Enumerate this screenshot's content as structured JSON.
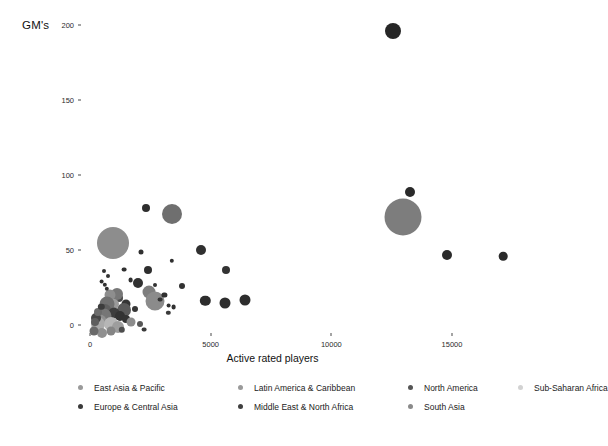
{
  "chart_data": {
    "type": "scatter",
    "title": "",
    "xlabel": "Active rated players",
    "ylabel": "GM's",
    "xlim": [
      -750,
      18000
    ],
    "ylim": [
      -12,
      210
    ],
    "xticks": [
      0,
      5000,
      10000,
      15000
    ],
    "xtick_labels": [
      "0",
      "5000",
      "10000",
      "15000"
    ],
    "yticks": [
      0,
      50,
      100,
      150,
      200
    ],
    "ytick_labels": [
      "0",
      "50",
      "100",
      "150",
      "200"
    ],
    "grid": false,
    "legend_position": "bottom",
    "size_encoding": "population / federation size",
    "color_encoding": "region",
    "legend": [
      {
        "label": "East Asia & Pacific",
        "color": "#9a9a9a"
      },
      {
        "label": "Latin America & Caribbean",
        "color": "#9a9a9a"
      },
      {
        "label": "North America",
        "color": "#555555"
      },
      {
        "label": "Sub-Saharan Africa",
        "color": "#d2d2d2"
      },
      {
        "label": "Europe & Central Asia",
        "color": "#3a3a3a"
      },
      {
        "label": "Middle East & North Africa",
        "color": "#3f3f3f"
      },
      {
        "label": "South Asia",
        "color": "#8a8a8a"
      }
    ],
    "points": [
      {
        "x": 12560,
        "y": 196,
        "r": 8.0,
        "color": "#262626",
        "region": "Europe & Central Asia"
      },
      {
        "x": 13250,
        "y": 89,
        "r": 5.0,
        "color": "#2a2a2a",
        "region": "Europe & Central Asia"
      },
      {
        "x": 12950,
        "y": 72,
        "r": 18.5,
        "color": "#7d7d7d",
        "region": "South Asia"
      },
      {
        "x": 2320,
        "y": 78,
        "r": 4.0,
        "color": "#2e2e2e",
        "region": "Europe & Central Asia"
      },
      {
        "x": 3400,
        "y": 74,
        "r": 10.0,
        "color": "#6f6f6f",
        "region": "East Asia & Pacific"
      },
      {
        "x": 960,
        "y": 55,
        "r": 16.0,
        "color": "#8d8d8d",
        "region": "East Asia & Pacific"
      },
      {
        "x": 14780,
        "y": 47,
        "r": 5.0,
        "color": "#2b2b2b",
        "region": "Europe & Central Asia"
      },
      {
        "x": 17130,
        "y": 46,
        "r": 4.3,
        "color": "#2b2b2b",
        "region": "Europe & Central Asia"
      },
      {
        "x": 4620,
        "y": 50,
        "r": 5.0,
        "color": "#303030",
        "region": "Europe & Central Asia"
      },
      {
        "x": 5630,
        "y": 37,
        "r": 4.0,
        "color": "#333333",
        "region": "Europe & Central Asia"
      },
      {
        "x": 2100,
        "y": 49,
        "r": 2.5,
        "color": "#303030",
        "region": "Europe & Central Asia"
      },
      {
        "x": 3380,
        "y": 43,
        "r": 2.2,
        "color": "#303030",
        "region": "Europe & Central Asia"
      },
      {
        "x": 4780,
        "y": 16,
        "r": 5.2,
        "color": "#2d2d2d",
        "region": "Europe & Central Asia"
      },
      {
        "x": 5590,
        "y": 15,
        "r": 5.5,
        "color": "#2d2d2d",
        "region": "Europe & Central Asia"
      },
      {
        "x": 6430,
        "y": 17,
        "r": 5.5,
        "color": "#2d2d2d",
        "region": "Europe & Central Asia"
      },
      {
        "x": 1980,
        "y": 28,
        "r": 5.0,
        "color": "#313131",
        "region": "Europe & Central Asia"
      },
      {
        "x": 2460,
        "y": 22,
        "r": 6.5,
        "color": "#7e7e7e",
        "region": "East Asia & Pacific"
      },
      {
        "x": 2700,
        "y": 16,
        "r": 9.5,
        "color": "#8b8b8b",
        "region": "East Asia & Pacific"
      },
      {
        "x": 1680,
        "y": 30,
        "r": 2.4,
        "color": "#303030",
        "region": "Europe & Central Asia"
      },
      {
        "x": 3080,
        "y": 20,
        "r": 2.6,
        "color": "#303030",
        "region": "Europe & Central Asia"
      },
      {
        "x": 3260,
        "y": 13,
        "r": 2.4,
        "color": "#303030",
        "region": "Europe & Central Asia"
      },
      {
        "x": 3460,
        "y": 12,
        "r": 2.4,
        "color": "#303030",
        "region": "Europe & Central Asia"
      },
      {
        "x": 3240,
        "y": 8,
        "r": 2.2,
        "color": "#3a3a3a",
        "region": "Middle East & North Africa"
      },
      {
        "x": 1480,
        "y": 14,
        "r": 4.5,
        "color": "#353535",
        "region": "Europe & Central Asia"
      },
      {
        "x": 1410,
        "y": 10,
        "r": 7.0,
        "color": "#5a5a5a",
        "region": "Europe & Central Asia"
      },
      {
        "x": 1210,
        "y": 18,
        "r": 4.0,
        "color": "#4a4a4a",
        "region": "Europe & Central Asia"
      },
      {
        "x": 1100,
        "y": 21,
        "r": 6.0,
        "color": "#777777",
        "region": "Latin America & Caribbean"
      },
      {
        "x": 980,
        "y": 14,
        "r": 5.0,
        "color": "#9a9a9a",
        "region": "Latin America & Caribbean"
      },
      {
        "x": 840,
        "y": 20,
        "r": 5.5,
        "color": "#8e8e8e",
        "region": "Latin America & Caribbean"
      },
      {
        "x": 700,
        "y": 14,
        "r": 7.5,
        "color": "#707070",
        "region": "Latin America & Caribbean"
      },
      {
        "x": 620,
        "y": 10,
        "r": 6.0,
        "color": "#5f5f5f",
        "region": "Europe & Central Asia"
      },
      {
        "x": 1000,
        "y": 8,
        "r": 5.5,
        "color": "#3d3d3d",
        "region": "Europe & Central Asia"
      },
      {
        "x": 1230,
        "y": 6,
        "r": 5.0,
        "color": "#333333",
        "region": "Europe & Central Asia"
      },
      {
        "x": 1500,
        "y": 4,
        "r": 4.0,
        "color": "#343434",
        "region": "Europe & Central Asia"
      },
      {
        "x": 1700,
        "y": 2,
        "r": 4.5,
        "color": "#8c8c8c",
        "region": "Latin America & Caribbean"
      },
      {
        "x": 2060,
        "y": 1,
        "r": 3.0,
        "color": "#575757",
        "region": "Europe & Central Asia"
      },
      {
        "x": 560,
        "y": 6,
        "r": 7.5,
        "color": "#767676",
        "region": "Latin America & Caribbean"
      },
      {
        "x": 430,
        "y": 3,
        "r": 6.5,
        "color": "#8f8f8f",
        "region": "Sub-Saharan Africa"
      },
      {
        "x": 350,
        "y": 1,
        "r": 7.0,
        "color": "#aaaaaa",
        "region": "Sub-Saharan Africa"
      },
      {
        "x": 880,
        "y": 1,
        "r": 7.0,
        "color": "#b6b6b6",
        "region": "Sub-Saharan Africa"
      },
      {
        "x": 1160,
        "y": -1,
        "r": 6.0,
        "color": "#9d9d9d",
        "region": "Latin America & Caribbean"
      },
      {
        "x": 250,
        "y": 5,
        "r": 5.0,
        "color": "#464646",
        "region": "Europe & Central Asia"
      },
      {
        "x": 200,
        "y": 2,
        "r": 4.0,
        "color": "#5e5e5e",
        "region": "Europe & Central Asia"
      },
      {
        "x": 330,
        "y": 9,
        "r": 4.0,
        "color": "#6c6c6c",
        "region": "Middle East & North Africa"
      },
      {
        "x": 470,
        "y": 12,
        "r": 3.2,
        "color": "#3c3c3c",
        "region": "Europe & Central Asia"
      },
      {
        "x": 700,
        "y": 24,
        "r": 2.2,
        "color": "#303030",
        "region": "Europe & Central Asia"
      },
      {
        "x": 480,
        "y": 29,
        "r": 2.4,
        "color": "#303030",
        "region": "Europe & Central Asia"
      },
      {
        "x": 620,
        "y": 27,
        "r": 2.2,
        "color": "#303030",
        "region": "Europe & Central Asia"
      },
      {
        "x": 560,
        "y": 36,
        "r": 2.0,
        "color": "#333333",
        "region": "Europe & Central Asia"
      },
      {
        "x": 1420,
        "y": 37,
        "r": 2.4,
        "color": "#303030",
        "region": "Europe & Central Asia"
      },
      {
        "x": 2420,
        "y": 37,
        "r": 4.0,
        "color": "#2e2e2e",
        "region": "Europe & Central Asia"
      },
      {
        "x": 3820,
        "y": 26,
        "r": 3.0,
        "color": "#323232",
        "region": "Europe & Central Asia"
      },
      {
        "x": 2920,
        "y": 17,
        "r": 2.4,
        "color": "#343434",
        "region": "Middle East & North Africa"
      },
      {
        "x": 1860,
        "y": 11,
        "r": 3.0,
        "color": "#363636",
        "region": "Europe & Central Asia"
      },
      {
        "x": 1330,
        "y": -3,
        "r": 3.2,
        "color": "#4d4d4d",
        "region": "Europe & Central Asia"
      },
      {
        "x": 880,
        "y": -4,
        "r": 4.5,
        "color": "#858585",
        "region": "Latin America & Caribbean"
      },
      {
        "x": 500,
        "y": -5,
        "r": 5.0,
        "color": "#909090",
        "region": "Sub-Saharan Africa"
      },
      {
        "x": 170,
        "y": -4,
        "r": 4.5,
        "color": "#6a6a6a",
        "region": "Middle East & North Africa"
      },
      {
        "x": 2240,
        "y": -3,
        "r": 2.4,
        "color": "#3a3a3a",
        "region": "Middle East & North Africa"
      },
      {
        "x": 750,
        "y": 33,
        "r": 2.0,
        "color": "#333333",
        "region": "Europe & Central Asia"
      },
      {
        "x": 2680,
        "y": 27,
        "r": 2.0,
        "color": "#323232",
        "region": "Europe & Central Asia"
      }
    ]
  }
}
